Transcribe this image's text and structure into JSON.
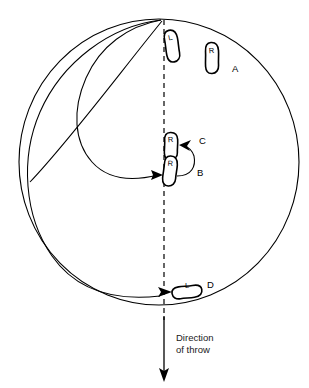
{
  "figure": {
    "type": "technical-diagram",
    "caption_lines": [
      "Direction",
      "of throw"
    ],
    "background_color": "#ffffff",
    "line_color": "#000000"
  },
  "circle": {
    "name": "throwing-circle",
    "center_x": 159,
    "center_y": 162,
    "radius_x": 140,
    "radius_y": 143
  },
  "center_line": {
    "name": "center-dashed-line",
    "x": 164,
    "y_top": 20,
    "y_bottom": 320,
    "dash": "5 4"
  },
  "direction_arrow": {
    "name": "direction-of-throw-arrow",
    "x": 178,
    "y_top": 316,
    "y_bottom": 381
  },
  "footprints": [
    {
      "id": "foot-A-left",
      "foot_label": "L",
      "position_label": "",
      "x": 172,
      "y": 46,
      "rotation": -12,
      "width": 13,
      "height": 32
    },
    {
      "id": "foot-A-right",
      "foot_label": "R",
      "position_label": "A",
      "x": 212,
      "y": 58,
      "rotation": -4,
      "width": 13,
      "height": 31
    },
    {
      "id": "foot-C-right",
      "foot_label": "R",
      "position_label": "C",
      "x": 171,
      "y": 146,
      "rotation": -3,
      "width": 13,
      "height": 27
    },
    {
      "id": "foot-B-right",
      "foot_label": "R",
      "position_label": "B",
      "x": 170,
      "y": 171,
      "rotation": 3,
      "width": 13,
      "height": 30
    },
    {
      "id": "foot-D-left",
      "foot_label": "L",
      "position_label": "D",
      "x": 187,
      "y": 292,
      "rotation": 80,
      "width": 12,
      "height": 31
    }
  ],
  "position_labels": [
    {
      "name": "label-A",
      "text": "A",
      "x": 232,
      "y": 72
    },
    {
      "name": "label-B",
      "text": "B",
      "x": 197,
      "y": 176
    },
    {
      "name": "label-C",
      "text": "C",
      "x": 199,
      "y": 144
    },
    {
      "name": "label-D",
      "text": "D",
      "x": 207,
      "y": 288
    }
  ],
  "motion_paths": [
    {
      "name": "path-to-B",
      "description": "swing path from top of circle around to B footprint"
    },
    {
      "name": "path-to-D",
      "description": "long sweeping path from top of circle to D footprint"
    },
    {
      "name": "path-B-to-C",
      "description": "short hooked arrow from B footprint up to C footprint"
    }
  ]
}
